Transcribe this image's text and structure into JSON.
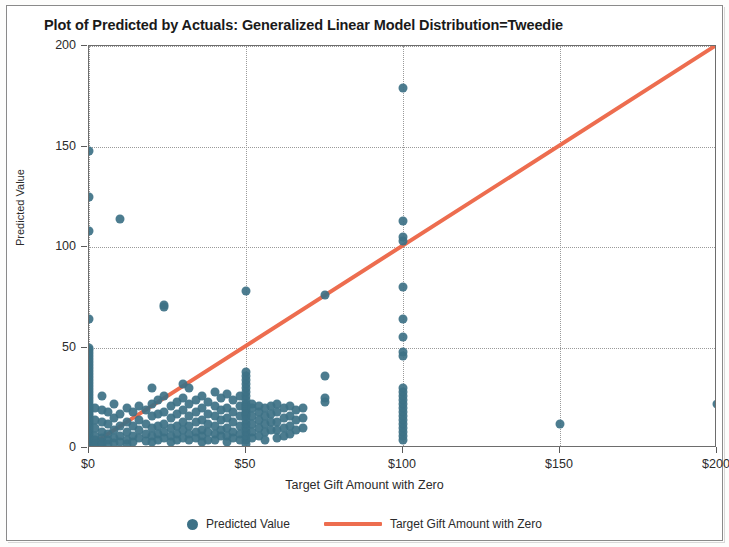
{
  "chart_data": {
    "type": "scatter",
    "title": "Plot of Predicted by Actuals: Generalized Linear Model Distribution=Tweedie",
    "xlabel": "Target Gift Amount with Zero",
    "ylabel": "Predicted Value",
    "xlim": [
      0,
      200
    ],
    "ylim": [
      0,
      200
    ],
    "grid": true,
    "legend_position": "bottom",
    "xticks": [
      0,
      50,
      100,
      150,
      200
    ],
    "xtick_labels": [
      "$0",
      "$50",
      "$100",
      "$150",
      "$200"
    ],
    "yticks": [
      0,
      50,
      100,
      150,
      200
    ],
    "ytick_labels": [
      "0",
      "50",
      "100",
      "150",
      "200"
    ],
    "series": [
      {
        "name": "Predicted Value",
        "type": "scatter",
        "color": "#3d7186",
        "marker": "circle",
        "marker_size": 9,
        "points": [
          [
            0,
            148
          ],
          [
            0,
            125
          ],
          [
            0,
            108
          ],
          [
            0,
            64
          ],
          [
            0,
            50
          ],
          [
            0,
            49
          ],
          [
            0,
            47.5
          ],
          [
            0,
            46
          ],
          [
            0,
            44.5
          ],
          [
            0,
            43
          ],
          [
            0,
            41.5
          ],
          [
            0,
            40
          ],
          [
            0,
            38.5
          ],
          [
            0,
            37
          ],
          [
            0,
            35.5
          ],
          [
            0,
            34
          ],
          [
            0,
            32.5
          ],
          [
            0,
            31
          ],
          [
            0,
            29.5
          ],
          [
            0,
            28
          ],
          [
            0,
            26.5
          ],
          [
            0,
            25
          ],
          [
            0,
            23.5
          ],
          [
            0,
            22
          ],
          [
            0,
            21
          ],
          [
            0,
            20
          ],
          [
            0,
            19
          ],
          [
            0,
            18
          ],
          [
            0,
            17
          ],
          [
            0,
            16
          ],
          [
            0,
            15
          ],
          [
            0,
            14
          ],
          [
            0,
            13
          ],
          [
            0,
            12
          ],
          [
            0,
            11
          ],
          [
            0,
            10
          ],
          [
            0,
            9
          ],
          [
            0,
            8
          ],
          [
            0,
            7
          ],
          [
            0,
            6
          ],
          [
            0,
            5
          ],
          [
            0,
            4.5
          ],
          [
            0,
            4
          ],
          [
            0,
            3.5
          ],
          [
            0,
            3
          ],
          [
            0,
            2.5
          ],
          [
            0,
            2
          ],
          [
            0,
            1.5
          ],
          [
            0,
            1
          ],
          [
            0,
            0.5
          ],
          [
            2,
            20
          ],
          [
            2,
            14
          ],
          [
            2,
            10
          ],
          [
            2,
            6
          ],
          [
            2,
            4
          ],
          [
            2,
            2
          ],
          [
            2,
            1
          ],
          [
            4,
            26
          ],
          [
            4,
            19
          ],
          [
            4,
            13
          ],
          [
            4,
            8
          ],
          [
            4,
            5
          ],
          [
            4,
            3
          ],
          [
            4,
            1.5
          ],
          [
            6,
            18
          ],
          [
            6,
            12
          ],
          [
            6,
            7
          ],
          [
            6,
            4
          ],
          [
            6,
            2
          ],
          [
            8,
            22
          ],
          [
            8,
            15
          ],
          [
            8,
            9
          ],
          [
            8,
            5
          ],
          [
            8,
            2.5
          ],
          [
            10,
            114
          ],
          [
            10,
            17
          ],
          [
            10,
            11
          ],
          [
            10,
            6
          ],
          [
            10,
            3
          ],
          [
            12,
            20
          ],
          [
            12,
            13
          ],
          [
            12,
            8
          ],
          [
            12,
            4
          ],
          [
            12,
            2
          ],
          [
            14,
            18
          ],
          [
            14,
            11
          ],
          [
            14,
            6
          ],
          [
            14,
            3
          ],
          [
            16,
            21
          ],
          [
            16,
            14
          ],
          [
            16,
            9
          ],
          [
            16,
            5
          ],
          [
            18,
            19
          ],
          [
            18,
            12
          ],
          [
            18,
            7
          ],
          [
            18,
            3.5
          ],
          [
            20,
            30
          ],
          [
            20,
            22
          ],
          [
            20,
            16
          ],
          [
            20,
            10
          ],
          [
            20,
            6
          ],
          [
            20,
            3
          ],
          [
            22,
            24
          ],
          [
            22,
            17
          ],
          [
            22,
            11
          ],
          [
            22,
            7
          ],
          [
            22,
            4
          ],
          [
            24,
            71
          ],
          [
            24,
            70
          ],
          [
            24,
            26
          ],
          [
            24,
            18
          ],
          [
            24,
            12
          ],
          [
            24,
            8
          ],
          [
            24,
            5
          ],
          [
            26,
            21
          ],
          [
            26,
            15
          ],
          [
            26,
            10
          ],
          [
            26,
            6
          ],
          [
            26,
            3
          ],
          [
            28,
            23
          ],
          [
            28,
            17
          ],
          [
            28,
            11
          ],
          [
            28,
            7
          ],
          [
            28,
            4
          ],
          [
            30,
            32
          ],
          [
            30,
            25
          ],
          [
            30,
            19
          ],
          [
            30,
            13
          ],
          [
            30,
            9
          ],
          [
            30,
            5
          ],
          [
            32,
            30
          ],
          [
            32,
            22
          ],
          [
            32,
            16
          ],
          [
            32,
            11
          ],
          [
            32,
            7
          ],
          [
            32,
            4
          ],
          [
            34,
            24
          ],
          [
            34,
            18
          ],
          [
            34,
            13
          ],
          [
            34,
            8
          ],
          [
            34,
            5
          ],
          [
            36,
            26
          ],
          [
            36,
            20
          ],
          [
            36,
            14
          ],
          [
            36,
            9
          ],
          [
            36,
            6
          ],
          [
            36,
            3
          ],
          [
            38,
            23
          ],
          [
            38,
            17
          ],
          [
            38,
            12
          ],
          [
            38,
            8
          ],
          [
            38,
            4
          ],
          [
            40,
            28
          ],
          [
            40,
            21
          ],
          [
            40,
            16
          ],
          [
            40,
            11
          ],
          [
            40,
            7
          ],
          [
            40,
            4
          ],
          [
            42,
            25
          ],
          [
            42,
            19
          ],
          [
            42,
            14
          ],
          [
            42,
            9
          ],
          [
            42,
            6
          ],
          [
            44,
            27
          ],
          [
            44,
            20
          ],
          [
            44,
            15
          ],
          [
            44,
            10
          ],
          [
            44,
            6
          ],
          [
            44,
            3
          ],
          [
            46,
            24
          ],
          [
            46,
            18
          ],
          [
            46,
            13
          ],
          [
            46,
            8
          ],
          [
            46,
            5
          ],
          [
            48,
            26
          ],
          [
            48,
            21
          ],
          [
            48,
            16
          ],
          [
            48,
            11
          ],
          [
            48,
            7
          ],
          [
            48,
            4
          ],
          [
            50,
            78
          ],
          [
            50,
            38
          ],
          [
            50,
            36
          ],
          [
            50,
            34
          ],
          [
            50,
            32
          ],
          [
            50,
            30
          ],
          [
            50,
            28
          ],
          [
            50,
            26
          ],
          [
            50,
            24
          ],
          [
            50,
            22
          ],
          [
            50,
            21
          ],
          [
            50,
            20
          ],
          [
            50,
            19
          ],
          [
            50,
            18
          ],
          [
            50,
            17
          ],
          [
            50,
            16
          ],
          [
            50,
            14
          ],
          [
            50,
            12
          ],
          [
            50,
            10
          ],
          [
            50,
            8
          ],
          [
            50,
            6
          ],
          [
            50,
            4
          ],
          [
            50,
            2
          ],
          [
            52,
            22
          ],
          [
            52,
            20
          ],
          [
            52,
            16
          ],
          [
            52,
            12
          ],
          [
            52,
            8
          ],
          [
            52,
            5
          ],
          [
            54,
            21
          ],
          [
            54,
            18
          ],
          [
            54,
            14
          ],
          [
            54,
            10
          ],
          [
            54,
            6
          ],
          [
            56,
            20
          ],
          [
            56,
            16
          ],
          [
            56,
            12
          ],
          [
            56,
            8
          ],
          [
            56,
            4
          ],
          [
            58,
            21
          ],
          [
            58,
            17
          ],
          [
            58,
            13
          ],
          [
            58,
            9
          ],
          [
            60,
            22
          ],
          [
            60,
            18
          ],
          [
            60,
            13
          ],
          [
            60,
            9
          ],
          [
            60,
            5
          ],
          [
            62,
            20
          ],
          [
            62,
            15
          ],
          [
            62,
            10
          ],
          [
            62,
            6
          ],
          [
            64,
            21
          ],
          [
            64,
            16
          ],
          [
            64,
            11
          ],
          [
            64,
            7
          ],
          [
            66,
            19
          ],
          [
            66,
            14
          ],
          [
            66,
            9
          ],
          [
            68,
            20
          ],
          [
            68,
            15
          ],
          [
            68,
            10
          ],
          [
            75,
            76
          ],
          [
            75,
            36
          ],
          [
            75,
            25
          ],
          [
            75,
            23
          ],
          [
            100,
            179
          ],
          [
            100,
            113
          ],
          [
            100,
            105
          ],
          [
            100,
            103
          ],
          [
            100,
            80
          ],
          [
            100,
            64
          ],
          [
            100,
            55
          ],
          [
            100,
            48
          ],
          [
            100,
            46
          ],
          [
            100,
            30
          ],
          [
            100,
            28
          ],
          [
            100,
            26
          ],
          [
            100,
            24
          ],
          [
            100,
            22
          ],
          [
            100,
            20
          ],
          [
            100,
            18
          ],
          [
            100,
            16
          ],
          [
            100,
            14
          ],
          [
            100,
            12
          ],
          [
            100,
            10
          ],
          [
            100,
            8
          ],
          [
            100,
            6
          ],
          [
            100,
            4
          ],
          [
            150,
            12
          ],
          [
            200,
            22
          ]
        ]
      },
      {
        "name": "Target Gift Amount with Zero",
        "type": "line",
        "color": "#ed6d4f",
        "line_width": 4,
        "points": [
          [
            0,
            0
          ],
          [
            200,
            200
          ]
        ]
      }
    ]
  },
  "legend": {
    "entries": [
      {
        "label": "Predicted Value",
        "marker": "circle-marker",
        "color": "#3d7186"
      },
      {
        "label": "Target Gift Amount with Zero",
        "marker": "line-marker",
        "color": "#ed6d4f"
      }
    ]
  }
}
